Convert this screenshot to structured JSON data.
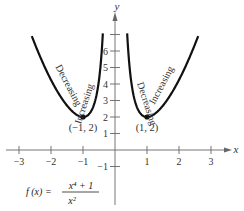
{
  "chart_data": {
    "type": "line",
    "function": "f(x) = (x^4 + 1) / x^2",
    "formula": {
      "lhs": "f (x) =",
      "numerator": "x⁴ + 1",
      "denominator": "x²"
    },
    "xlabel": "x",
    "ylabel": "y",
    "xlim": [
      -3.3,
      3.8
    ],
    "ylim": [
      -1.5,
      8.8
    ],
    "x_ticks": [
      -3,
      -2,
      -1,
      1,
      2,
      3
    ],
    "x_tick_labels": [
      "−3",
      "−2",
      "−1",
      "1",
      "2",
      "3"
    ],
    "y_ticks": [
      -1,
      1,
      2,
      3,
      4,
      5,
      6,
      7
    ],
    "y_tick_labels": [
      "−1",
      "1",
      "2",
      "3",
      "4",
      "5",
      "6",
      ""
    ],
    "grid": false,
    "series": [
      {
        "name": "left branch",
        "x_range": [
          -2.6,
          -0.38
        ]
      },
      {
        "name": "right branch",
        "x_range": [
          0.38,
          2.6
        ]
      }
    ],
    "points": [
      {
        "x": -1,
        "y": 2,
        "label": "(−1, 2)"
      },
      {
        "x": 1,
        "y": 2,
        "label": "(1, 2)"
      }
    ],
    "annotations": [
      {
        "text": "Decreasing",
        "branch": "left",
        "side": "outer"
      },
      {
        "text": "Increasing",
        "branch": "left",
        "side": "inner"
      },
      {
        "text": "Decreasing",
        "branch": "right",
        "side": "inner"
      },
      {
        "text": "Increasing",
        "branch": "right",
        "side": "outer"
      }
    ]
  }
}
